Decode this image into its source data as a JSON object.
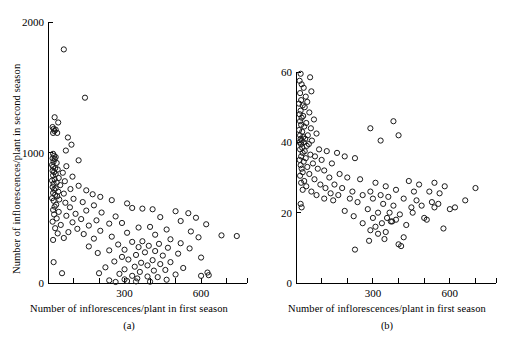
{
  "figure": {
    "title": "",
    "panel_count": 2
  },
  "panels": [
    {
      "id": "a",
      "caption": "(a)",
      "xlabel": "Number of inflorescences/plant in first season",
      "ylabel": "Number of inflorescences/plant in second season",
      "x_ticks_labeled": [
        "300",
        "600"
      ],
      "y_ticks_labeled": [
        "0",
        "1000",
        "2000"
      ]
    },
    {
      "id": "b",
      "caption": "(b)",
      "xlabel": "Number of inflorescences/plant in first season",
      "ylabel": "Plant size in second season (cm)",
      "x_ticks_labeled": [
        "300",
        "600"
      ],
      "y_ticks_labeled": [
        "0",
        "20",
        "40",
        "60"
      ]
    }
  ],
  "chart_data": [
    {
      "type": "scatter",
      "panel": "a",
      "title": "",
      "xlabel": "Number of inflorescences/plant in first season",
      "ylabel": "Number of inflorescences/plant in second season",
      "xlim": [
        0,
        780
      ],
      "ylim": [
        0,
        2000
      ],
      "xticks": [
        0,
        100,
        200,
        300,
        400,
        500,
        600,
        700
      ],
      "xtick_labels": [
        "",
        "",
        "",
        "300",
        "",
        "",
        "600",
        ""
      ],
      "yticks": [
        0,
        1000,
        2000
      ],
      "ytick_labels": [
        "0",
        "1000",
        "2000"
      ],
      "grid": false,
      "legend": false,
      "marker": "open-circle",
      "points": [
        [
          62,
          1790
        ],
        [
          145,
          1420
        ],
        [
          26,
          1270
        ],
        [
          40,
          1230
        ],
        [
          18,
          1195
        ],
        [
          22,
          1180
        ],
        [
          30,
          1175
        ],
        [
          25,
          1165
        ],
        [
          20,
          1150
        ],
        [
          36,
          1150
        ],
        [
          78,
          1115
        ],
        [
          92,
          1060
        ],
        [
          70,
          1015
        ],
        [
          20,
          990
        ],
        [
          24,
          975
        ],
        [
          30,
          965
        ],
        [
          18,
          955
        ],
        [
          26,
          950
        ],
        [
          120,
          940
        ],
        [
          22,
          930
        ],
        [
          34,
          920
        ],
        [
          16,
          905
        ],
        [
          72,
          895
        ],
        [
          20,
          890
        ],
        [
          28,
          880
        ],
        [
          38,
          870
        ],
        [
          18,
          860
        ],
        [
          24,
          850
        ],
        [
          58,
          845
        ],
        [
          30,
          835
        ],
        [
          20,
          825
        ],
        [
          96,
          815
        ],
        [
          42,
          805
        ],
        [
          26,
          795
        ],
        [
          16,
          785
        ],
        [
          66,
          780
        ],
        [
          34,
          770
        ],
        [
          22,
          760
        ],
        [
          48,
          750
        ],
        [
          120,
          745
        ],
        [
          18,
          735
        ],
        [
          30,
          725
        ],
        [
          88,
          720
        ],
        [
          24,
          715
        ],
        [
          150,
          710
        ],
        [
          40,
          700
        ],
        [
          20,
          690
        ],
        [
          62,
          685
        ],
        [
          175,
          680
        ],
        [
          28,
          675
        ],
        [
          36,
          665
        ],
        [
          205,
          660
        ],
        [
          16,
          650
        ],
        [
          100,
          645
        ],
        [
          44,
          640
        ],
        [
          250,
          635
        ],
        [
          22,
          630
        ],
        [
          136,
          620
        ],
        [
          68,
          615
        ],
        [
          310,
          610
        ],
        [
          32,
          600
        ],
        [
          180,
          595
        ],
        [
          26,
          585
        ],
        [
          86,
          580
        ],
        [
          330,
          575
        ],
        [
          370,
          570
        ],
        [
          410,
          565
        ],
        [
          20,
          560
        ],
        [
          150,
          555
        ],
        [
          500,
          550
        ],
        [
          42,
          545
        ],
        [
          210,
          540
        ],
        [
          550,
          535
        ],
        [
          108,
          530
        ],
        [
          24,
          525
        ],
        [
          72,
          515
        ],
        [
          265,
          510
        ],
        [
          440,
          505
        ],
        [
          580,
          500
        ],
        [
          34,
          495
        ],
        [
          130,
          490
        ],
        [
          190,
          480
        ],
        [
          520,
          475
        ],
        [
          18,
          470
        ],
        [
          96,
          465
        ],
        [
          290,
          460
        ],
        [
          240,
          455
        ],
        [
          620,
          450
        ],
        [
          50,
          445
        ],
        [
          160,
          440
        ],
        [
          400,
          430
        ],
        [
          355,
          425
        ],
        [
          28,
          420
        ],
        [
          115,
          415
        ],
        [
          465,
          410
        ],
        [
          205,
          400
        ],
        [
          560,
          395
        ],
        [
          80,
          390
        ],
        [
          310,
          385
        ],
        [
          38,
          380
        ],
        [
          140,
          375
        ],
        [
          420,
          370
        ],
        [
          680,
          365
        ],
        [
          740,
          360
        ],
        [
          250,
          355
        ],
        [
          590,
          350
        ],
        [
          62,
          345
        ],
        [
          180,
          340
        ],
        [
          480,
          335
        ],
        [
          20,
          330
        ],
        [
          370,
          320
        ],
        [
          330,
          315
        ],
        [
          520,
          305
        ],
        [
          435,
          300
        ],
        [
          275,
          295
        ],
        [
          395,
          285
        ],
        [
          160,
          280
        ],
        [
          355,
          275
        ],
        [
          470,
          270
        ],
        [
          555,
          265
        ],
        [
          300,
          255
        ],
        [
          240,
          250
        ],
        [
          420,
          245
        ],
        [
          380,
          235
        ],
        [
          195,
          230
        ],
        [
          510,
          225
        ],
        [
          345,
          215
        ],
        [
          450,
          210
        ],
        [
          290,
          200
        ],
        [
          600,
          195
        ],
        [
          315,
          180
        ],
        [
          410,
          175
        ],
        [
          260,
          165
        ],
        [
          480,
          160
        ],
        [
          365,
          155
        ],
        [
          440,
          145
        ],
        [
          390,
          135
        ],
        [
          340,
          125
        ],
        [
          225,
          120
        ],
        [
          530,
          115
        ],
        [
          300,
          105
        ],
        [
          460,
          100
        ],
        [
          415,
          95
        ],
        [
          360,
          85
        ],
        [
          625,
          80
        ],
        [
          200,
          75
        ],
        [
          280,
          70
        ],
        [
          500,
          65
        ],
        [
          330,
          55
        ],
        [
          390,
          50
        ],
        [
          430,
          45
        ],
        [
          350,
          35
        ],
        [
          300,
          28
        ],
        [
          465,
          25
        ],
        [
          240,
          20
        ],
        [
          310,
          15
        ],
        [
          345,
          12
        ],
        [
          400,
          10
        ],
        [
          265,
          8
        ],
        [
          22,
          160
        ],
        [
          55,
          75
        ],
        [
          600,
          55
        ],
        [
          630,
          60
        ]
      ]
    },
    {
      "type": "scatter",
      "panel": "b",
      "title": "",
      "xlabel": "Number of inflorescences/plant in first season",
      "ylabel": "Plant size in second season (cm)",
      "xlim": [
        0,
        780
      ],
      "ylim": [
        0,
        62
      ],
      "xticks": [
        0,
        100,
        200,
        300,
        400,
        500,
        600,
        700
      ],
      "xtick_labels": [
        "",
        "",
        "",
        "300",
        "",
        "",
        "600",
        ""
      ],
      "yticks": [
        0,
        20,
        40,
        60
      ],
      "ytick_labels": [
        "0",
        "20",
        "40",
        "60"
      ],
      "grid": false,
      "legend": false,
      "marker": "open-circle",
      "points": [
        [
          18,
          59.5
        ],
        [
          55,
          58.5
        ],
        [
          14,
          57.5
        ],
        [
          22,
          56.5
        ],
        [
          30,
          55.5
        ],
        [
          60,
          54.5
        ],
        [
          16,
          54
        ],
        [
          38,
          53
        ],
        [
          20,
          52
        ],
        [
          44,
          51.5
        ],
        [
          12,
          51
        ],
        [
          26,
          50.5
        ],
        [
          34,
          50
        ],
        [
          18,
          49
        ],
        [
          52,
          48.5
        ],
        [
          14,
          48
        ],
        [
          28,
          47.5
        ],
        [
          22,
          47
        ],
        [
          70,
          46.5
        ],
        [
          16,
          46
        ],
        [
          40,
          45.5
        ],
        [
          20,
          45
        ],
        [
          32,
          44.5
        ],
        [
          58,
          44
        ],
        [
          12,
          43.5
        ],
        [
          24,
          43
        ],
        [
          80,
          42.5
        ],
        [
          16,
          42
        ],
        [
          46,
          42
        ],
        [
          28,
          41.5
        ],
        [
          18,
          41
        ],
        [
          36,
          41
        ],
        [
          22,
          40.5
        ],
        [
          62,
          40.5
        ],
        [
          14,
          40
        ],
        [
          30,
          40
        ],
        [
          50,
          39.5
        ],
        [
          20,
          39.5
        ],
        [
          42,
          39
        ],
        [
          24,
          38.5
        ],
        [
          16,
          38
        ],
        [
          90,
          38
        ],
        [
          34,
          37.5
        ],
        [
          120,
          37.5
        ],
        [
          26,
          37
        ],
        [
          160,
          37
        ],
        [
          56,
          36.5
        ],
        [
          20,
          36
        ],
        [
          74,
          36
        ],
        [
          190,
          36
        ],
        [
          38,
          35.5
        ],
        [
          14,
          35
        ],
        [
          100,
          35
        ],
        [
          230,
          35.5
        ],
        [
          30,
          34.5
        ],
        [
          66,
          34
        ],
        [
          140,
          34
        ],
        [
          18,
          33.5
        ],
        [
          44,
          33
        ],
        [
          290,
          44
        ],
        [
          22,
          32.5
        ],
        [
          85,
          32.5
        ],
        [
          330,
          40.5
        ],
        [
          110,
          32
        ],
        [
          380,
          46
        ],
        [
          26,
          31.5
        ],
        [
          52,
          31
        ],
        [
          170,
          31
        ],
        [
          400,
          42
        ],
        [
          16,
          30.5
        ],
        [
          200,
          30
        ],
        [
          130,
          30
        ],
        [
          72,
          29.5
        ],
        [
          32,
          29
        ],
        [
          250,
          29.5
        ],
        [
          20,
          28.5
        ],
        [
          95,
          28
        ],
        [
          150,
          28
        ],
        [
          310,
          28.5
        ],
        [
          40,
          27.5
        ],
        [
          440,
          29
        ],
        [
          180,
          27
        ],
        [
          115,
          27
        ],
        [
          480,
          28
        ],
        [
          26,
          26.5
        ],
        [
          350,
          27.5
        ],
        [
          60,
          26
        ],
        [
          540,
          28.5
        ],
        [
          220,
          26
        ],
        [
          135,
          25.5
        ],
        [
          580,
          27.5
        ],
        [
          290,
          26
        ],
        [
          80,
          25
        ],
        [
          390,
          26.5
        ],
        [
          165,
          25
        ],
        [
          260,
          25
        ],
        [
          460,
          26
        ],
        [
          520,
          26
        ],
        [
          110,
          24
        ],
        [
          330,
          25
        ],
        [
          700,
          27
        ],
        [
          210,
          24
        ],
        [
          360,
          24.5
        ],
        [
          560,
          25.5
        ],
        [
          145,
          23.5
        ],
        [
          18,
          22.5
        ],
        [
          22,
          21.5
        ],
        [
          300,
          24
        ],
        [
          420,
          24
        ],
        [
          620,
          21.5
        ],
        [
          240,
          23
        ],
        [
          490,
          22
        ],
        [
          190,
          20.5
        ],
        [
          340,
          22.5
        ],
        [
          540,
          21.5
        ],
        [
          380,
          22
        ],
        [
          280,
          21
        ],
        [
          600,
          21
        ],
        [
          320,
          20
        ],
        [
          450,
          21.5
        ],
        [
          405,
          19.5
        ],
        [
          225,
          19
        ],
        [
          355,
          18.5
        ],
        [
          300,
          18.5
        ],
        [
          500,
          18.5
        ],
        [
          390,
          18
        ],
        [
          370,
          17.5
        ],
        [
          375,
          17.5
        ],
        [
          510,
          18
        ],
        [
          260,
          17
        ],
        [
          335,
          17
        ],
        [
          310,
          16
        ],
        [
          430,
          16.5
        ],
        [
          575,
          15.5
        ],
        [
          290,
          15
        ],
        [
          350,
          14.5
        ],
        [
          320,
          14
        ],
        [
          420,
          13
        ],
        [
          285,
          12
        ],
        [
          400,
          11
        ],
        [
          410,
          10.5
        ],
        [
          230,
          9.5
        ],
        [
          345,
          12.5
        ],
        [
          365,
          20
        ],
        [
          455,
          20
        ],
        [
          470,
          23.5
        ],
        [
          530,
          23
        ],
        [
          555,
          22.5
        ],
        [
          660,
          23.5
        ]
      ]
    }
  ]
}
